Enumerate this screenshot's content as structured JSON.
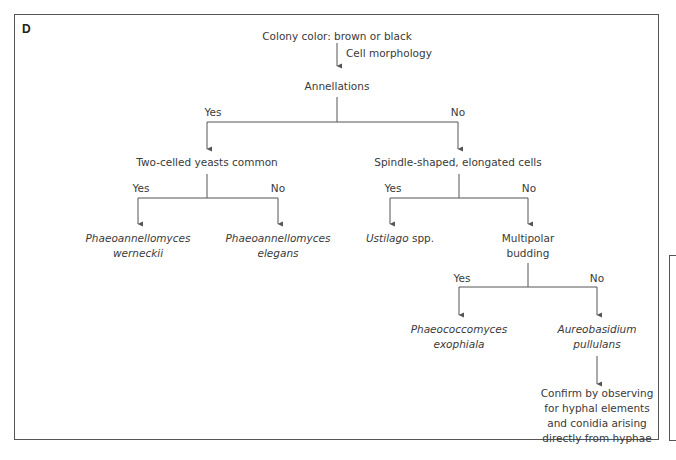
{
  "diagram": {
    "panel_label": "D",
    "root": {
      "text": "Colony color: brown or black",
      "edge_label": "Cell morphology"
    },
    "annellations": {
      "text": "Annellations",
      "yes_label": "Yes",
      "no_label": "No"
    },
    "two_celled": {
      "text": "Two-celled yeasts common",
      "yes_label": "Yes",
      "no_label": "No",
      "yes_leaf": {
        "line1": "Phaeoannellomyces",
        "line2": "werneckii"
      },
      "no_leaf": {
        "line1": "Phaeoannellomyces",
        "line2": "elegans"
      }
    },
    "spindle": {
      "text": "Spindle-shaped, elongated cells",
      "yes_label": "Yes",
      "no_label": "No",
      "yes_leaf": {
        "genus": "Ustilago",
        "suffix": " spp."
      }
    },
    "multipolar": {
      "line1": "Multipolar",
      "line2": "budding",
      "yes_label": "Yes",
      "no_label": "No",
      "yes_leaf": {
        "line1": "Phaeococcomyces",
        "line2": "exophiala"
      },
      "no_leaf": {
        "line1": "Aureobasidium",
        "line2": "pullulans"
      }
    },
    "confirm": {
      "lines": [
        "Confirm by observing",
        "for hyphal elements",
        "and conidia arising",
        "directly from hyphae"
      ]
    }
  },
  "colors": {
    "line": "#555555",
    "text": "#3a3a3a",
    "background": "#ffffff"
  }
}
